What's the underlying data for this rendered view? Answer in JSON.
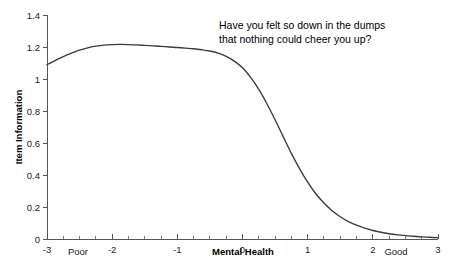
{
  "chart_data": {
    "type": "line",
    "title": "",
    "annotation": {
      "line1": "Have you felt so down in the dumps",
      "line2": "that nothing could cheer you up?"
    },
    "xlabel": "Mental Health",
    "ylabel": "Item Information",
    "xlim": [
      -3,
      3
    ],
    "ylim": [
      0,
      1.4
    ],
    "grid": false,
    "legend": null,
    "x_anchor_low": "Poor",
    "x_anchor_high": "Good",
    "xticks": [
      "-3",
      "-2",
      "-1",
      "0",
      "1",
      "2",
      "3"
    ],
    "xtick_values": [
      -3,
      -2,
      -1,
      0,
      1,
      2,
      3
    ],
    "x_minor_per_interval": 4,
    "yticks": [
      "0",
      "0.2",
      "0.4",
      "0.6",
      "0.8",
      "1",
      "1.2",
      "1.4"
    ],
    "ytick_values": [
      0,
      0.2,
      0.4,
      0.6,
      0.8,
      1,
      1.2,
      1.4
    ],
    "series": [
      {
        "name": "Item Information",
        "color": "#3a3a3a",
        "x": [
          -3,
          -2.875,
          -2.75,
          -2.625,
          -2.5,
          -2.375,
          -2.25,
          -2.125,
          -2,
          -1.875,
          -1.75,
          -1.625,
          -1.5,
          -1.375,
          -1.25,
          -1.125,
          -1,
          -0.875,
          -0.75,
          -0.625,
          -0.5,
          -0.375,
          -0.25,
          -0.125,
          0,
          0.125,
          0.25,
          0.375,
          0.5,
          0.625,
          0.75,
          0.875,
          1,
          1.125,
          1.25,
          1.375,
          1.5,
          1.625,
          1.75,
          1.875,
          2,
          2.125,
          2.25,
          2.375,
          2.5,
          2.625,
          2.75,
          2.875,
          3
        ],
        "y": [
          1.09,
          1.115,
          1.14,
          1.162,
          1.18,
          1.195,
          1.205,
          1.212,
          1.215,
          1.216,
          1.215,
          1.213,
          1.21,
          1.207,
          1.204,
          1.2,
          1.197,
          1.193,
          1.189,
          1.183,
          1.175,
          1.162,
          1.142,
          1.112,
          1.07,
          1.01,
          0.935,
          0.845,
          0.745,
          0.64,
          0.535,
          0.44,
          0.355,
          0.283,
          0.225,
          0.177,
          0.139,
          0.109,
          0.086,
          0.068,
          0.053,
          0.042,
          0.033,
          0.026,
          0.021,
          0.017,
          0.013,
          0.011,
          0.008
        ]
      }
    ]
  }
}
